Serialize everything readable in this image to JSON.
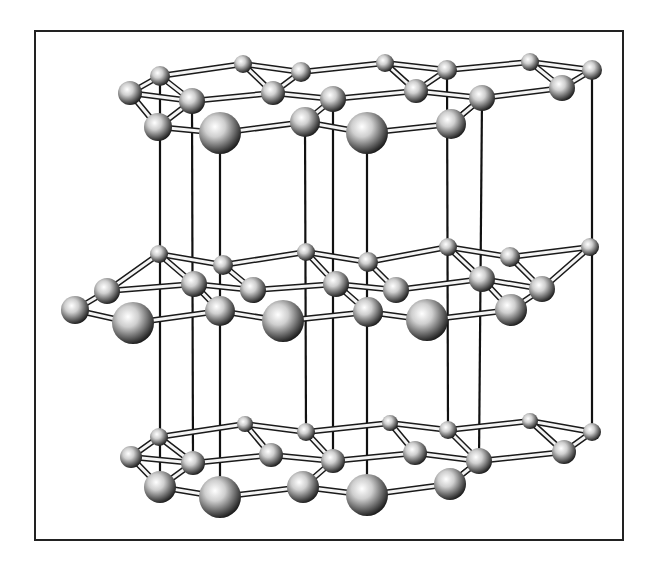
{
  "figure": {
    "title": "",
    "frame": {
      "x": 35,
      "y": 31,
      "w": 588,
      "h": 509
    },
    "colors": {
      "frame": "#222222",
      "bond": "#1a1a1a",
      "atom_light": "#ffffff",
      "atom_dark": "#111111"
    },
    "layers": [
      {
        "name": "top-layer",
        "atoms": [
          [
            130,
            93,
            12
          ],
          [
            160,
            76,
            10
          ],
          [
            243,
            64,
            9
          ],
          [
            301,
            72,
            10
          ],
          [
            385,
            63,
            9
          ],
          [
            447,
            70,
            10
          ],
          [
            530,
            62,
            9
          ],
          [
            592,
            70,
            10
          ],
          [
            192,
            101,
            13
          ],
          [
            273,
            93,
            12
          ],
          [
            333,
            99,
            13
          ],
          [
            416,
            91,
            12
          ],
          [
            482,
            98,
            13
          ],
          [
            562,
            88,
            13
          ],
          [
            158,
            127,
            14
          ],
          [
            220,
            133,
            21
          ],
          [
            305,
            122,
            15
          ],
          [
            367,
            133,
            21
          ],
          [
            451,
            124,
            15
          ]
        ],
        "bonds": [
          [
            0,
            1
          ],
          [
            1,
            2
          ],
          [
            2,
            3
          ],
          [
            3,
            4
          ],
          [
            4,
            5
          ],
          [
            5,
            6
          ],
          [
            6,
            7
          ],
          [
            0,
            8
          ],
          [
            8,
            9
          ],
          [
            9,
            10
          ],
          [
            10,
            11
          ],
          [
            11,
            12
          ],
          [
            12,
            13
          ],
          [
            13,
            7
          ],
          [
            0,
            14
          ],
          [
            14,
            15
          ],
          [
            15,
            16
          ],
          [
            16,
            17
          ],
          [
            17,
            18
          ],
          [
            18,
            12
          ],
          [
            1,
            8
          ],
          [
            3,
            9
          ],
          [
            5,
            11
          ],
          [
            8,
            14
          ],
          [
            10,
            16
          ],
          [
            12,
            18
          ],
          [
            2,
            9
          ],
          [
            4,
            11
          ],
          [
            6,
            13
          ]
        ]
      },
      {
        "name": "middle-layer",
        "atoms": [
          [
            107,
            291,
            13
          ],
          [
            159,
            254,
            9
          ],
          [
            223,
            265,
            10
          ],
          [
            306,
            252,
            9
          ],
          [
            368,
            262,
            10
          ],
          [
            448,
            247,
            9
          ],
          [
            510,
            257,
            10
          ],
          [
            590,
            247,
            9
          ],
          [
            194,
            284,
            13
          ],
          [
            253,
            290,
            13
          ],
          [
            336,
            284,
            13
          ],
          [
            396,
            290,
            13
          ],
          [
            482,
            279,
            13
          ],
          [
            542,
            289,
            13
          ],
          [
            75,
            310,
            14
          ],
          [
            133,
            323,
            21
          ],
          [
            220,
            311,
            15
          ],
          [
            283,
            321,
            21
          ],
          [
            368,
            312,
            15
          ],
          [
            427,
            320,
            21
          ],
          [
            511,
            310,
            16
          ]
        ],
        "bonds": [
          [
            0,
            1
          ],
          [
            1,
            2
          ],
          [
            2,
            3
          ],
          [
            3,
            4
          ],
          [
            4,
            5
          ],
          [
            5,
            6
          ],
          [
            6,
            7
          ],
          [
            0,
            8
          ],
          [
            8,
            9
          ],
          [
            9,
            10
          ],
          [
            10,
            11
          ],
          [
            11,
            12
          ],
          [
            12,
            13
          ],
          [
            13,
            7
          ],
          [
            14,
            0
          ],
          [
            14,
            15
          ],
          [
            15,
            16
          ],
          [
            16,
            17
          ],
          [
            17,
            18
          ],
          [
            18,
            19
          ],
          [
            19,
            20
          ],
          [
            20,
            13
          ],
          [
            1,
            8
          ],
          [
            3,
            10
          ],
          [
            5,
            12
          ],
          [
            8,
            16
          ],
          [
            10,
            18
          ],
          [
            12,
            20
          ],
          [
            2,
            9
          ],
          [
            4,
            11
          ],
          [
            6,
            13
          ]
        ]
      },
      {
        "name": "bottom-layer",
        "atoms": [
          [
            131,
            457,
            11
          ],
          [
            159,
            437,
            9
          ],
          [
            245,
            424,
            8
          ],
          [
            306,
            432,
            9
          ],
          [
            390,
            423,
            8
          ],
          [
            448,
            430,
            9
          ],
          [
            530,
            421,
            8
          ],
          [
            592,
            432,
            9
          ],
          [
            193,
            463,
            12
          ],
          [
            271,
            455,
            12
          ],
          [
            333,
            461,
            12
          ],
          [
            415,
            453,
            12
          ],
          [
            479,
            461,
            13
          ],
          [
            564,
            452,
            12
          ],
          [
            160,
            487,
            16
          ],
          [
            220,
            497,
            21
          ],
          [
            303,
            487,
            16
          ],
          [
            367,
            495,
            21
          ],
          [
            450,
            484,
            16
          ]
        ],
        "bonds": [
          [
            0,
            1
          ],
          [
            1,
            2
          ],
          [
            2,
            3
          ],
          [
            3,
            4
          ],
          [
            4,
            5
          ],
          [
            5,
            6
          ],
          [
            6,
            7
          ],
          [
            0,
            8
          ],
          [
            8,
            9
          ],
          [
            9,
            10
          ],
          [
            10,
            11
          ],
          [
            11,
            12
          ],
          [
            12,
            13
          ],
          [
            13,
            7
          ],
          [
            0,
            14
          ],
          [
            14,
            15
          ],
          [
            15,
            16
          ],
          [
            16,
            17
          ],
          [
            17,
            18
          ],
          [
            18,
            12
          ],
          [
            1,
            8
          ],
          [
            3,
            10
          ],
          [
            5,
            12
          ],
          [
            8,
            14
          ],
          [
            10,
            16
          ],
          [
            12,
            18
          ],
          [
            2,
            9
          ],
          [
            4,
            11
          ],
          [
            6,
            13
          ]
        ]
      }
    ],
    "vertical_rods_x": [
      160,
      194,
      222,
      306,
      333,
      369,
      449,
      482,
      592
    ]
  }
}
